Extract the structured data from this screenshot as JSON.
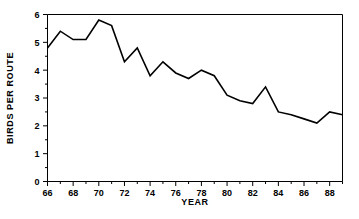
{
  "chart_data": {
    "type": "line",
    "title": "",
    "xlabel": "YEAR",
    "ylabel": "BIRDS PER ROUTE",
    "xlim": [
      66,
      89
    ],
    "ylim": [
      0,
      6
    ],
    "grid": false,
    "legend": null,
    "x_major_ticks": [
      66,
      68,
      70,
      72,
      74,
      76,
      78,
      80,
      82,
      84,
      86,
      88
    ],
    "x_major_tick_labels": [
      "66",
      "68",
      "70",
      "72",
      "74",
      "76",
      "78",
      "80",
      "82",
      "84",
      "86",
      "88"
    ],
    "x_minor_ticks": [
      67,
      69,
      71,
      73,
      75,
      77,
      79,
      81,
      83,
      85,
      87,
      89
    ],
    "y_major_ticks": [
      0,
      1,
      2,
      3,
      4,
      5,
      6
    ],
    "y_major_tick_labels": [
      "0",
      "1",
      "2",
      "3",
      "4",
      "5",
      "6"
    ],
    "y_minor_ticks": [
      0.5,
      1.5,
      2.5,
      3.5,
      4.5,
      5.5
    ],
    "x": [
      66,
      67,
      68,
      69,
      70,
      71,
      72,
      73,
      74,
      75,
      76,
      77,
      78,
      79,
      80,
      81,
      82,
      83,
      84,
      85,
      86,
      87,
      88,
      89
    ],
    "values": [
      4.8,
      5.4,
      5.1,
      5.1,
      5.8,
      5.6,
      4.3,
      4.8,
      3.8,
      4.3,
      3.9,
      3.7,
      4.0,
      3.8,
      3.1,
      2.9,
      2.8,
      3.4,
      2.5,
      2.4,
      2.25,
      2.1,
      2.5,
      2.4
    ],
    "series": [
      {
        "name": "Birds per route",
        "color": "#000000",
        "values": [
          4.8,
          5.4,
          5.1,
          5.1,
          5.8,
          5.6,
          4.3,
          4.8,
          3.8,
          4.3,
          3.9,
          3.7,
          4.0,
          3.8,
          3.1,
          2.9,
          2.8,
          3.4,
          2.5,
          2.4,
          2.25,
          2.1,
          2.5,
          2.4
        ]
      }
    ]
  },
  "colors": {
    "line": "#000000",
    "axis": "#000000",
    "background": "#ffffff"
  }
}
